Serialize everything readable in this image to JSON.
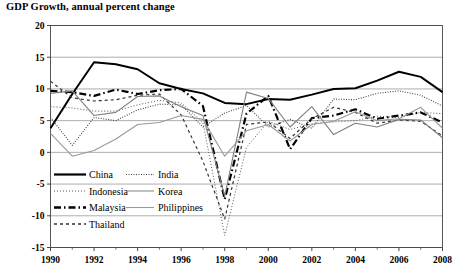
{
  "chart_title": "GDP Growth, annual percent change",
  "axes": {
    "y_ticks": [
      "20",
      "15",
      "10",
      "5",
      "0",
      "-5",
      "-10",
      "-15"
    ],
    "x_ticks": [
      "1990",
      "1992",
      "1994",
      "1996",
      "1998",
      "2000",
      "2002",
      "2004",
      "2006",
      "2008"
    ]
  },
  "legend": {
    "col1": [
      {
        "label": "China",
        "style": "solid-thick"
      },
      {
        "label": "Indonesia",
        "style": "dotted-fine"
      },
      {
        "label": "Malaysia",
        "style": "dash-dot-thick"
      },
      {
        "label": "Thailand",
        "style": "dashed"
      }
    ],
    "col2": [
      {
        "label": "India",
        "style": "dotted-dense"
      },
      {
        "label": "Korea",
        "style": "solid-light"
      },
      {
        "label": "Philippines",
        "style": "solid-gray"
      }
    ]
  },
  "chart_data": {
    "type": "line",
    "title": "GDP Growth, annual percent change",
    "xlabel": "",
    "ylabel": "",
    "xlim": [
      1990,
      2008
    ],
    "ylim": [
      -15,
      20
    ],
    "grid": true,
    "legend_position": "inside-lower-left",
    "x": [
      1990,
      1991,
      1992,
      1993,
      1994,
      1995,
      1996,
      1997,
      1998,
      1999,
      2000,
      2001,
      2002,
      2003,
      2004,
      2005,
      2006,
      2007,
      2008
    ],
    "series": [
      {
        "name": "China",
        "color": "#000000",
        "width": 2.0,
        "dash": "none",
        "values": [
          3.8,
          9.2,
          14.2,
          13.9,
          13.1,
          10.9,
          10.0,
          9.3,
          7.8,
          7.6,
          8.4,
          8.3,
          9.1,
          10.0,
          10.1,
          11.3,
          12.7,
          11.9,
          9.5
        ]
      },
      {
        "name": "Indonesia",
        "color": "#555555",
        "width": 1.0,
        "dash": "1,2",
        "values": [
          7.2,
          7.0,
          6.5,
          6.5,
          7.5,
          8.2,
          7.8,
          4.7,
          -13.1,
          0.8,
          4.9,
          3.6,
          4.5,
          4.8,
          5.0,
          5.7,
          5.5,
          6.3,
          6.1
        ]
      },
      {
        "name": "Malaysia",
        "color": "#000000",
        "width": 2.2,
        "dash": "7,3,1.5,3",
        "values": [
          9.7,
          9.5,
          8.9,
          9.9,
          9.2,
          9.8,
          10.0,
          7.3,
          -7.4,
          6.1,
          8.9,
          0.5,
          5.4,
          5.8,
          6.8,
          5.3,
          5.8,
          6.3,
          4.7
        ]
      },
      {
        "name": "Thailand",
        "color": "#333333",
        "width": 1.2,
        "dash": "3,3",
        "values": [
          11.2,
          8.6,
          8.1,
          8.3,
          9.0,
          9.2,
          5.9,
          -1.4,
          -10.5,
          4.4,
          4.8,
          2.2,
          5.3,
          7.1,
          6.3,
          4.6,
          5.1,
          4.9,
          2.6
        ]
      },
      {
        "name": "India",
        "color": "#444444",
        "width": 1.1,
        "dash": "1,1.5",
        "values": [
          5.5,
          1.1,
          5.5,
          5.0,
          6.7,
          7.6,
          7.5,
          4.0,
          6.2,
          7.4,
          4.0,
          5.2,
          3.8,
          8.4,
          8.3,
          9.3,
          9.7,
          9.0,
          7.3
        ]
      },
      {
        "name": "Korea",
        "color": "#808080",
        "width": 1.1,
        "dash": "none",
        "values": [
          9.3,
          9.7,
          5.8,
          6.3,
          8.8,
          8.9,
          7.2,
          5.8,
          -6.9,
          9.5,
          8.5,
          4.0,
          7.2,
          2.8,
          4.6,
          4.0,
          5.2,
          5.1,
          2.3
        ]
      },
      {
        "name": "Philippines",
        "color": "#999999",
        "width": 1.1,
        "dash": "none",
        "values": [
          3.0,
          -0.6,
          0.3,
          2.1,
          4.4,
          4.7,
          5.8,
          5.2,
          -0.6,
          3.4,
          4.4,
          1.8,
          4.4,
          4.9,
          6.4,
          5.0,
          5.3,
          7.1,
          3.8
        ]
      }
    ]
  }
}
